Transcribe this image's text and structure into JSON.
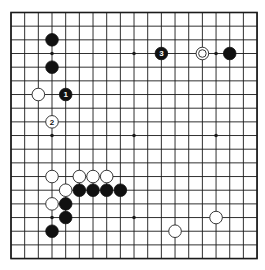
{
  "board": {
    "size": 19,
    "origin_x": 11,
    "origin_y": 12.5,
    "spacing": 13.67,
    "stone_radius": 6.3,
    "colors": {
      "line": "#1a1a1a",
      "black": "#111111",
      "white": "#ffffff",
      "background": "#ffffff"
    },
    "star_points": [
      [
        3,
        3
      ],
      [
        9,
        3
      ],
      [
        15,
        3
      ],
      [
        3,
        9
      ],
      [
        9,
        9
      ],
      [
        15,
        9
      ],
      [
        3,
        15
      ],
      [
        9,
        15
      ],
      [
        15,
        15
      ]
    ],
    "stones": [
      {
        "color": "black",
        "col": 3,
        "row": 2,
        "label": ""
      },
      {
        "color": "black",
        "col": 3,
        "row": 4,
        "label": ""
      },
      {
        "color": "white",
        "col": 2,
        "row": 6,
        "label": ""
      },
      {
        "color": "black",
        "col": 4,
        "row": 6,
        "label": "1"
      },
      {
        "color": "white",
        "col": 3,
        "row": 8,
        "label": "2"
      },
      {
        "color": "black",
        "col": 11,
        "row": 3,
        "label": "3"
      },
      {
        "color": "white",
        "col": 14,
        "row": 3,
        "label": "",
        "marker": "circle"
      },
      {
        "color": "black",
        "col": 16,
        "row": 3,
        "label": ""
      },
      {
        "color": "white",
        "col": 3,
        "row": 12,
        "label": ""
      },
      {
        "color": "white",
        "col": 5,
        "row": 12,
        "label": ""
      },
      {
        "color": "white",
        "col": 6,
        "row": 12,
        "label": ""
      },
      {
        "color": "white",
        "col": 7,
        "row": 12,
        "label": ""
      },
      {
        "color": "white",
        "col": 4,
        "row": 13,
        "label": ""
      },
      {
        "color": "black",
        "col": 5,
        "row": 13,
        "label": ""
      },
      {
        "color": "black",
        "col": 6,
        "row": 13,
        "label": ""
      },
      {
        "color": "black",
        "col": 7,
        "row": 13,
        "label": ""
      },
      {
        "color": "black",
        "col": 8,
        "row": 13,
        "label": ""
      },
      {
        "color": "white",
        "col": 3,
        "row": 14,
        "label": ""
      },
      {
        "color": "black",
        "col": 4,
        "row": 14,
        "label": ""
      },
      {
        "color": "black",
        "col": 4,
        "row": 15,
        "label": ""
      },
      {
        "color": "black",
        "col": 3,
        "row": 16,
        "label": ""
      },
      {
        "color": "white",
        "col": 15,
        "row": 15,
        "label": ""
      },
      {
        "color": "white",
        "col": 12,
        "row": 16,
        "label": ""
      }
    ]
  }
}
